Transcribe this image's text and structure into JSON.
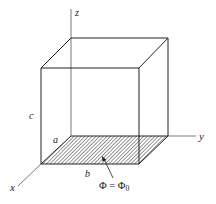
{
  "diagram": {
    "type": "3d-box-with-axes",
    "axes": {
      "x": {
        "label": "x"
      },
      "y": {
        "label": "y"
      },
      "z": {
        "label": "z"
      }
    },
    "dimensions": {
      "a": "a",
      "b": "b",
      "c": "c"
    },
    "boundary_condition": {
      "label": "Φ = Φ",
      "subscript": "0",
      "surface": "bottom face (hatched)"
    },
    "colors": {
      "line": "#222222",
      "axis": "#555555",
      "hatch": "#444444",
      "background": "#ffffff"
    }
  }
}
